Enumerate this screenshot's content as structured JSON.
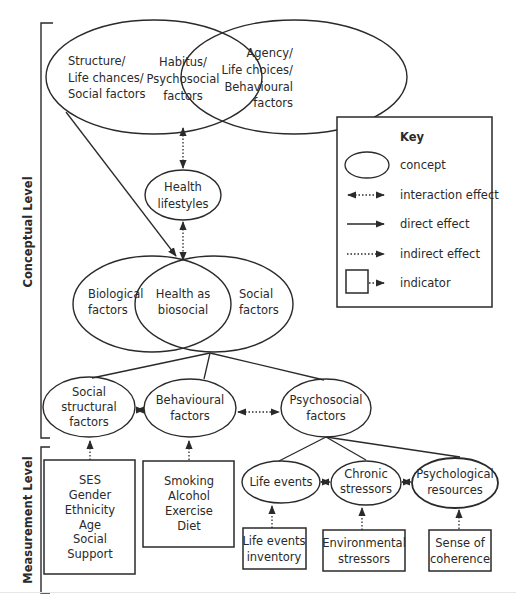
{
  "levels": {
    "conceptual": "Conceptual Level",
    "measurement": "Measurement Level"
  },
  "concepts": {
    "structure": [
      "Structure/",
      "Life chances/",
      "Social factors"
    ],
    "habitus": [
      "Habitus/",
      "Psychosocial",
      "factors"
    ],
    "agency": [
      "Agency/",
      "Life choices/",
      "Behavioural",
      "factors"
    ],
    "health_lifestyles": [
      "Health",
      "lifestyles"
    ],
    "biological": [
      "Biological",
      "factors"
    ],
    "health_biosocial": [
      "Health as",
      "biosocial"
    ],
    "social": [
      "Social",
      "factors"
    ],
    "social_structural": [
      "Social",
      "structural",
      "factors"
    ],
    "behavioural": [
      "Behavioural",
      "factors"
    ],
    "psychosocial": [
      "Psychosocial",
      "factors"
    ],
    "life_events": [
      "Life events"
    ],
    "chronic_stressors": [
      "Chronic",
      "stressors"
    ],
    "psychological_resources": [
      "Psychological",
      "resources"
    ]
  },
  "indicators": {
    "social_structural": [
      "SES",
      "Gender",
      "Ethnicity",
      "Age",
      "Social",
      "Support"
    ],
    "behavioural": [
      "Smoking",
      "Alcohol",
      "Exercise",
      "Diet"
    ],
    "life_events": [
      "Life events",
      "inventory"
    ],
    "chronic_stressors": [
      "Environmental",
      "stressors"
    ],
    "psychological_resources": [
      "Sense of",
      "coherence"
    ]
  },
  "key": {
    "title": "Key",
    "items": [
      {
        "symbol": "ellipse",
        "label": "concept"
      },
      {
        "symbol": "double-dotted-arrow",
        "label": "interaction effect"
      },
      {
        "symbol": "solid-arrow",
        "label": "direct effect"
      },
      {
        "symbol": "dotted-arrow",
        "label": "indirect effect"
      },
      {
        "symbol": "box-dotted-arrow",
        "label": "indicator"
      }
    ]
  }
}
